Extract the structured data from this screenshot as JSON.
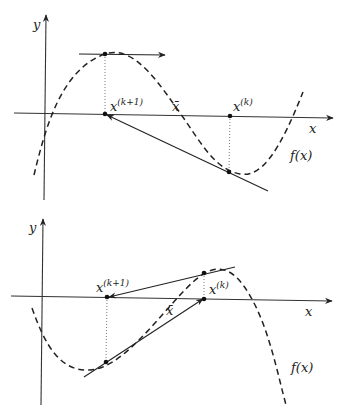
{
  "figure": {
    "panels": [
      {
        "id": "top",
        "axis_labels": {
          "x": "x",
          "y": "y"
        },
        "function_label": "f(x)",
        "root_label": "x̄",
        "iterates": [
          {
            "name": "x^(k+1)",
            "base": "x",
            "sup": "(k+1)"
          },
          {
            "name": "x^(k)",
            "base": "x",
            "sup": "(k)"
          }
        ],
        "note": "Tangent at x^(k) lands at x^(k+1) where f has a horizontal tangent (arrow to the right)."
      },
      {
        "id": "bottom",
        "axis_labels": {
          "x": "x",
          "y": "y"
        },
        "function_label": "f(x)",
        "root_label": "x̄",
        "iterates": [
          {
            "name": "x^(k+1)",
            "base": "x",
            "sup": "(k+1)"
          },
          {
            "name": "x^(k)",
            "base": "x",
            "sup": "(k)"
          }
        ],
        "note": "Iterates cycle between x^(k) and x^(k+1) around the root."
      }
    ]
  },
  "labels": {
    "top_y": "y",
    "top_x": "x",
    "top_fx": "f(x)",
    "top_xbar": "x̄",
    "top_xk1_base": "x",
    "top_xk1_sup": "(k+1)",
    "top_xk_base": "x",
    "top_xk_sup": "(k)",
    "bot_y": "y",
    "bot_x": "x",
    "bot_fx": "f(x)",
    "bot_xbar": "x̄",
    "bot_xk1_base": "x",
    "bot_xk1_sup": "(k+1)",
    "bot_xk_base": "x",
    "bot_xk_sup": "(k)"
  }
}
